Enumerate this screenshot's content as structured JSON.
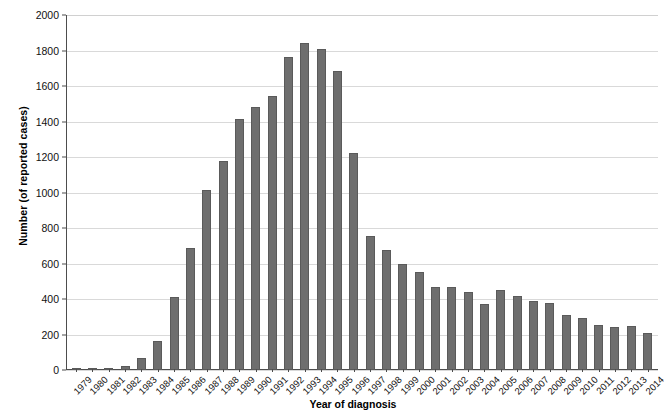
{
  "chart_data": {
    "type": "bar",
    "title": "",
    "xlabel": "Year of diagnosis",
    "ylabel": "Number (of reported cases)",
    "ylim": [
      0,
      2000
    ],
    "yticks": [
      0,
      200,
      400,
      600,
      800,
      1000,
      1200,
      1400,
      1600,
      1800,
      2000
    ],
    "grid": true,
    "legend": "none",
    "bar_color": "#6e6e6e",
    "bar_edge_color": "#5a5a5a",
    "gridline_color": "#d9d9d9",
    "axis_color": "#4d4d4d",
    "categories": [
      "1979",
      "1980",
      "1981",
      "1982",
      "1983",
      "1984",
      "1985",
      "1986",
      "1987",
      "1988",
      "1989",
      "1990",
      "1991",
      "1992",
      "1993",
      "1994",
      "1995",
      "1996",
      "1997",
      "1998",
      "1999",
      "2000",
      "2001",
      "2002",
      "2003",
      "2004",
      "2005",
      "2006",
      "2007",
      "2008",
      "2009",
      "2010",
      "2011",
      "2012",
      "2013",
      "2014"
    ],
    "values": [
      2,
      3,
      10,
      25,
      65,
      165,
      410,
      690,
      1015,
      1180,
      1415,
      1480,
      1545,
      1765,
      1845,
      1810,
      1685,
      1220,
      755,
      675,
      595,
      555,
      470,
      470,
      440,
      370,
      450,
      415,
      390,
      380,
      310,
      292,
      252,
      240,
      247,
      208
    ]
  }
}
